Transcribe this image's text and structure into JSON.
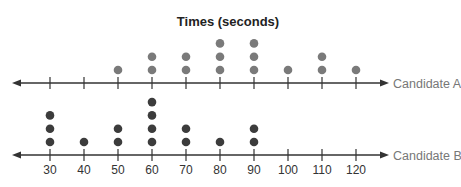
{
  "chart_data": {
    "type": "dot_plot",
    "title": "Times (seconds)",
    "xlabel": "",
    "ylabel": "",
    "x_ticks": [
      30,
      40,
      50,
      60,
      70,
      80,
      90,
      100,
      110,
      120
    ],
    "xlim": [
      30,
      120
    ],
    "grid": false,
    "legend": "none (series labeled at right end of each number line)",
    "series": [
      {
        "name": "Candidate A",
        "color": "#7a7a7a",
        "counts": {
          "30": 0,
          "40": 0,
          "50": 1,
          "60": 2,
          "70": 2,
          "80": 3,
          "90": 3,
          "100": 1,
          "110": 2,
          "120": 1
        },
        "values": [
          50,
          60,
          60,
          70,
          70,
          80,
          80,
          80,
          90,
          90,
          90,
          100,
          110,
          110,
          120
        ]
      },
      {
        "name": "Candidate B",
        "color": "#3c3c3c",
        "counts": {
          "30": 3,
          "40": 1,
          "50": 2,
          "60": 4,
          "70": 2,
          "80": 1,
          "90": 2,
          "100": 0,
          "110": 0,
          "120": 0
        },
        "values": [
          30,
          30,
          30,
          40,
          50,
          50,
          60,
          60,
          60,
          60,
          70,
          70,
          80,
          90,
          90
        ]
      }
    ]
  },
  "colors": {
    "axis": "#333333",
    "title": "#222222",
    "series_label": "#777777"
  }
}
